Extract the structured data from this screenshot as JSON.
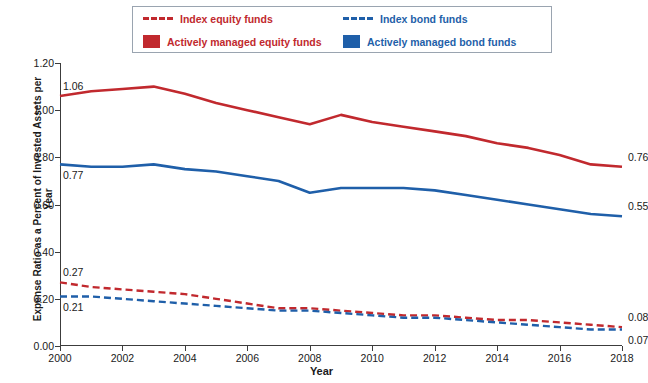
{
  "chart_data": {
    "type": "line",
    "title": "",
    "xlabel": "Year",
    "ylabel": "Expense Ratio as a Percent of Invested Assets per Year",
    "x": [
      2000,
      2001,
      2002,
      2003,
      2004,
      2005,
      2006,
      2007,
      2008,
      2009,
      2010,
      2011,
      2012,
      2013,
      2014,
      2015,
      2016,
      2017,
      2018
    ],
    "xlim": [
      2000,
      2018
    ],
    "ylim": [
      0.0,
      1.2
    ],
    "yticks": [
      "0.00",
      "0.20",
      "0.40",
      "0.60",
      "0.80",
      "1.00",
      "1.20"
    ],
    "xticks": [
      "2000",
      "2002",
      "2004",
      "2006",
      "2008",
      "2010",
      "2012",
      "2014",
      "2016",
      "2018"
    ],
    "grid": false,
    "legend_position": "top-center",
    "series": [
      {
        "name": "Actively managed equity funds",
        "color": "#c1292e",
        "style": "solid",
        "values": [
          1.06,
          1.08,
          1.09,
          1.1,
          1.07,
          1.03,
          1.0,
          0.97,
          0.94,
          0.98,
          0.95,
          0.93,
          0.91,
          0.89,
          0.86,
          0.84,
          0.81,
          0.77,
          0.76
        ]
      },
      {
        "name": "Actively managed bond funds",
        "color": "#1f5fa9",
        "style": "solid",
        "values": [
          0.77,
          0.76,
          0.76,
          0.77,
          0.75,
          0.74,
          0.72,
          0.7,
          0.65,
          0.67,
          0.67,
          0.67,
          0.66,
          0.64,
          0.62,
          0.6,
          0.58,
          0.56,
          0.55
        ]
      },
      {
        "name": "Index equity funds",
        "color": "#c1292e",
        "style": "dashed",
        "values": [
          0.27,
          0.25,
          0.24,
          0.23,
          0.22,
          0.2,
          0.18,
          0.16,
          0.16,
          0.15,
          0.14,
          0.13,
          0.13,
          0.12,
          0.11,
          0.11,
          0.1,
          0.09,
          0.08
        ]
      },
      {
        "name": "Index bond funds",
        "color": "#1f5fa9",
        "style": "dashed",
        "values": [
          0.21,
          0.21,
          0.2,
          0.19,
          0.18,
          0.17,
          0.16,
          0.15,
          0.15,
          0.14,
          0.13,
          0.12,
          0.12,
          0.11,
          0.1,
          0.09,
          0.08,
          0.07,
          0.07
        ]
      }
    ],
    "annotations": [
      {
        "text": "1.06",
        "x": 2000,
        "y": 1.06,
        "placement": "above-left"
      },
      {
        "text": "0.77",
        "x": 2000,
        "y": 0.77,
        "placement": "below-left"
      },
      {
        "text": "0.27",
        "x": 2000,
        "y": 0.27,
        "placement": "above-left"
      },
      {
        "text": "0.21",
        "x": 2000,
        "y": 0.21,
        "placement": "below-left"
      },
      {
        "text": "0.76",
        "x": 2018,
        "y": 0.76,
        "placement": "above-right"
      },
      {
        "text": "0.55",
        "x": 2018,
        "y": 0.55,
        "placement": "above-right"
      },
      {
        "text": "0.08",
        "x": 2018,
        "y": 0.08,
        "placement": "above-right"
      },
      {
        "text": "0.07",
        "x": 2018,
        "y": 0.07,
        "placement": "below-right"
      }
    ]
  },
  "legend": {
    "items": [
      {
        "label": "Index equity funds",
        "color": "#c1292e",
        "marker": "dashed-line"
      },
      {
        "label": "Index bond funds",
        "color": "#1f5fa9",
        "marker": "dashed-line"
      },
      {
        "label": "Actively managed equity funds",
        "color": "#c1292e",
        "marker": "solid-square"
      },
      {
        "label": "Actively managed bond funds",
        "color": "#1f5fa9",
        "marker": "solid-square"
      }
    ]
  }
}
